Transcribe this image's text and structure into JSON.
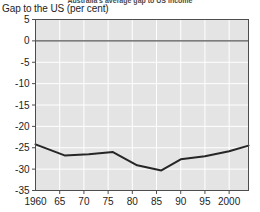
{
  "caption": {
    "text": "Australia's average gap to US income"
  },
  "chart_data": {
    "type": "line",
    "title": "",
    "ylabel": "Gap to the US (per cent)",
    "xlabel": "",
    "xlim": [
      1960,
      2004
    ],
    "ylim": [
      -35,
      5
    ],
    "yticks": [
      5,
      0,
      -5,
      -10,
      -15,
      -20,
      -25,
      -30,
      -35
    ],
    "ytick_labels": [
      "5",
      "0",
      "-5",
      "-10",
      "-15",
      "-20",
      "-25",
      "-30",
      "-35"
    ],
    "xticks": [
      1960,
      1965,
      1970,
      1975,
      1980,
      1985,
      1990,
      1995,
      2000
    ],
    "xtick_labels": [
      "1960",
      "65",
      "70",
      "75",
      "80",
      "85",
      "90",
      "95",
      "2000"
    ],
    "grid": true,
    "legend": "none",
    "plot_bgcolor": "#e4e4e4",
    "gridline_color": "#ffffff",
    "line_color": "#262626",
    "zero_line_color": "#555555",
    "series": [
      {
        "name": "Gap to the US",
        "x": [
          1960,
          1966,
          1971,
          1976,
          1981,
          1986,
          1990,
          1995,
          2000,
          2004
        ],
        "values": [
          -24.2,
          -26.8,
          -26.5,
          -26.0,
          -29.1,
          -30.3,
          -27.7,
          -27.0,
          -25.8,
          -24.5
        ]
      }
    ]
  }
}
